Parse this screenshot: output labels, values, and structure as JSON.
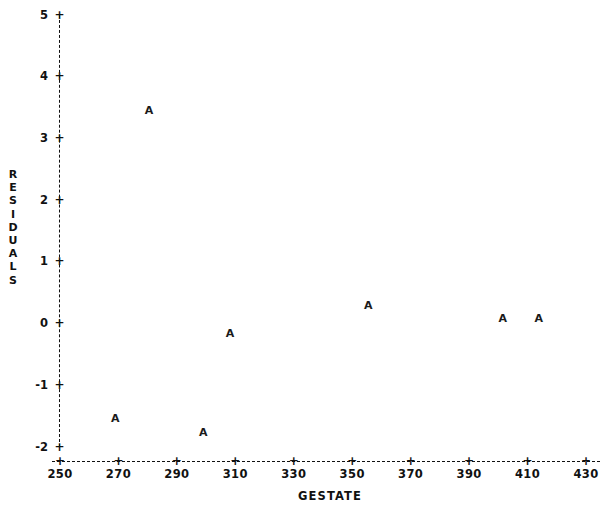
{
  "chart_data": {
    "type": "scatter",
    "title": "",
    "xlabel": "GESTATE",
    "ylabel": "RESIDUALS",
    "xlim": [
      250,
      430
    ],
    "ylim": [
      -2,
      5
    ],
    "xticks": [
      250,
      270,
      290,
      310,
      330,
      350,
      370,
      390,
      410,
      430
    ],
    "yticks": [
      -2,
      -1,
      0,
      1,
      2,
      3,
      4,
      5
    ],
    "xtick_labels": [
      "250",
      "270",
      "290",
      "310",
      "330",
      "350",
      "370",
      "390",
      "410",
      "430"
    ],
    "ytick_labels": [
      "-2",
      "-1",
      "0",
      "1",
      "2",
      "3",
      "4",
      "5"
    ],
    "grid": false,
    "legend": null,
    "point_marker": "A",
    "tick_marker": "+",
    "axis_style": "dashed",
    "points": [
      {
        "label": "A",
        "x": 280.5,
        "y": 3.45
      },
      {
        "label": "A",
        "x": 268.9,
        "y": -1.55
      },
      {
        "label": "A",
        "x": 299.0,
        "y": -1.78
      },
      {
        "label": "A",
        "x": 308.2,
        "y": -0.17
      },
      {
        "label": "A",
        "x": 355.5,
        "y": 0.28
      },
      {
        "label": "A",
        "x": 401.5,
        "y": 0.08
      },
      {
        "label": "A",
        "x": 413.8,
        "y": 0.08
      }
    ]
  },
  "axes": {
    "y_title_letters": [
      "R",
      "E",
      "S",
      "I",
      "D",
      "U",
      "A",
      "L",
      "S"
    ],
    "x_title": "GESTATE"
  },
  "colors": {
    "background": "#ffffff",
    "foreground": "#111111",
    "marker": "#1a1a1a"
  }
}
